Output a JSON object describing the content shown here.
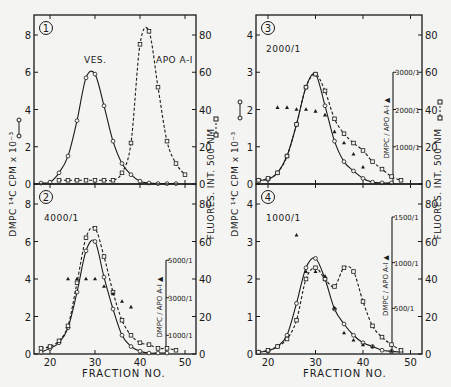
{
  "figure": {
    "x_axis_label": "FRACTION NO.",
    "x_ticks": [
      20,
      30,
      40,
      50
    ],
    "left_axis_label": "DMPC ¹⁴C CPM x 10⁻³",
    "left_axis_label_left_col": "DMPC ¹⁴C CPM x 10⁻²",
    "right_axis_label": "FLUORES. INT. 500 NM",
    "inner_axis_label": "DMPC / APO A-I",
    "legend_solid": "o—o",
    "legend_dashed": "□--□",
    "legend_triangle": "▲"
  },
  "chart_data": [
    {
      "panel": 1,
      "type": "line",
      "title": "",
      "annotations": [
        "VES.",
        "APO A-I"
      ],
      "xlabel": "FRACTION NO.",
      "ylabel": "DMPC 14C CPM x 10^-2",
      "y2label": "FLUORES. INT. 500 NM",
      "xlim": [
        16.4,
        52
      ],
      "ylim": [
        0,
        8.5
      ],
      "y_ticks": [
        0,
        2,
        4,
        6,
        8
      ],
      "y2lim": [
        0,
        85
      ],
      "y2_ticks": [
        0,
        20,
        40,
        60,
        80
      ],
      "series": [
        {
          "name": "DMPC 14C CPM (circles, solid)",
          "axis": "left",
          "x": [
            18,
            20,
            22,
            24,
            26,
            28,
            30,
            32,
            34,
            36,
            38,
            40,
            42,
            44,
            46,
            48
          ],
          "y": [
            0.05,
            0.1,
            0.6,
            1.5,
            3.4,
            5.7,
            5.9,
            4.2,
            2.3,
            1.1,
            0.5,
            0.15,
            0.05,
            0.02,
            0.02,
            0.02
          ]
        },
        {
          "name": "Fluorescence 500nm (squares, dashed)",
          "axis": "right",
          "x": [
            22,
            24,
            26,
            28,
            30,
            32,
            34,
            36,
            38,
            40,
            42,
            44,
            46,
            48,
            50
          ],
          "y": [
            2,
            2,
            2,
            2,
            2,
            2,
            2,
            6,
            22,
            75,
            82,
            52,
            23,
            11,
            5
          ]
        }
      ]
    },
    {
      "panel": 2,
      "type": "line",
      "annotations": [
        "4000/1"
      ],
      "xlabel": "FRACTION NO.",
      "ylabel": "DMPC 14C CPM x 10^-3",
      "y2label": "FLUORES. INT. 500 NM",
      "inner_axis": {
        "label": "DMPC / APO A-I",
        "ticks": [
          "1000/1",
          "3000/1",
          "5000/1"
        ],
        "range": [
          0,
          5000
        ]
      },
      "xlim": [
        16.4,
        52
      ],
      "ylim": [
        0,
        8.5
      ],
      "y_ticks": [
        0,
        2,
        4,
        6,
        8
      ],
      "y2lim": [
        0,
        85
      ],
      "y2_ticks": [
        0,
        20,
        40,
        60,
        80
      ],
      "series": [
        {
          "name": "DMPC 14C CPM (circles, solid)",
          "axis": "left",
          "x": [
            18,
            20,
            22,
            24,
            26,
            28,
            30,
            32,
            34,
            36,
            38,
            40,
            42,
            44,
            46
          ],
          "y": [
            0.1,
            0.3,
            0.6,
            1.4,
            3.3,
            5.5,
            6.0,
            4.1,
            2.4,
            1.0,
            0.4,
            0.15,
            0.05,
            0.05,
            0.05
          ]
        },
        {
          "name": "Fluorescence 500nm (squares, dashed)",
          "axis": "right",
          "x": [
            18,
            20,
            22,
            24,
            26,
            28,
            30,
            32,
            34,
            36,
            38,
            40,
            42,
            44,
            46,
            48
          ],
          "y": [
            3,
            4,
            7,
            15,
            38,
            62,
            67,
            52,
            33,
            18,
            10,
            6,
            5,
            3,
            3,
            2
          ]
        },
        {
          "name": "DMPC/APO A-I ratio (triangles)",
          "axis": "inner",
          "x": [
            24,
            26,
            28,
            30,
            32,
            34,
            36,
            38
          ],
          "y": [
            4000,
            4000,
            4000,
            4000,
            3600,
            3200,
            2800,
            2500
          ]
        }
      ]
    },
    {
      "panel": 3,
      "type": "line",
      "annotations": [
        "2000/1"
      ],
      "xlabel": "FRACTION NO.",
      "ylabel": "DMPC 14C CPM x 10^-3",
      "y2label": "FLUORES. INT. 500 NM",
      "inner_axis": {
        "label": "DMPC / APO A-I",
        "ticks": [
          "1000/1",
          "2000/1",
          "3000/1"
        ],
        "range": [
          0,
          3000
        ]
      },
      "xlim": [
        17.5,
        52
      ],
      "ylim": [
        0,
        4.25
      ],
      "y_ticks": [
        0,
        1,
        2,
        3,
        4
      ],
      "y2lim": [
        0,
        85
      ],
      "y2_ticks": [
        0,
        20,
        40,
        60,
        80
      ],
      "series": [
        {
          "name": "DMPC 14C CPM (circles, solid)",
          "axis": "left",
          "x": [
            18,
            20,
            22,
            24,
            26,
            28,
            30,
            32,
            34,
            36,
            38,
            40,
            42,
            44,
            46
          ],
          "y": [
            0.1,
            0.12,
            0.3,
            0.75,
            1.6,
            2.6,
            2.95,
            2.1,
            1.15,
            0.6,
            0.35,
            0.15,
            0.05,
            0.03,
            0.03
          ]
        },
        {
          "name": "Fluorescence 500nm (squares, dashed)",
          "axis": "right",
          "x": [
            18,
            20,
            22,
            24,
            26,
            28,
            30,
            32,
            34,
            36,
            38,
            40,
            42,
            44,
            46,
            48
          ],
          "y": [
            2,
            3,
            6,
            15,
            32,
            52,
            59,
            50,
            35,
            27,
            22,
            18,
            12,
            8,
            4,
            2
          ]
        },
        {
          "name": "DMPC/APO A-I ratio (triangles)",
          "axis": "inner",
          "x": [
            22,
            24,
            26,
            28,
            30,
            32,
            34,
            36,
            38,
            40
          ],
          "y": [
            2050,
            2050,
            2000,
            2000,
            1950,
            1850,
            1400,
            1100,
            800,
            450
          ]
        }
      ]
    },
    {
      "panel": 4,
      "type": "line",
      "annotations": [
        "1000/1"
      ],
      "xlabel": "FRACTION NO.",
      "ylabel": "DMPC 14C CPM x 10^-3",
      "y2label": "FLUORES. INT. 500 NM",
      "inner_axis": {
        "label": "DMPC / APO A-I",
        "ticks": [
          "500/1",
          "1000/1",
          "1500/1"
        ],
        "range": [
          0,
          1500
        ]
      },
      "xlim": [
        17.5,
        52
      ],
      "ylim": [
        0,
        4.25
      ],
      "y_ticks": [
        0,
        1,
        2,
        3,
        4
      ],
      "y2lim": [
        0,
        85
      ],
      "y2_ticks": [
        0,
        20,
        40,
        60,
        80
      ],
      "series": [
        {
          "name": "DMPC 14C CPM (circles, solid)",
          "axis": "left",
          "x": [
            18,
            20,
            22,
            24,
            26,
            28,
            30,
            32,
            34,
            36,
            38,
            40,
            42,
            44,
            46,
            48
          ],
          "y": [
            0.05,
            0.08,
            0.2,
            0.5,
            1.35,
            2.3,
            2.55,
            2.0,
            1.2,
            0.8,
            0.5,
            0.3,
            0.2,
            0.1,
            0.07,
            0.05
          ]
        },
        {
          "name": "Fluorescence 500nm (squares, dashed)",
          "axis": "right",
          "x": [
            18,
            20,
            22,
            24,
            26,
            28,
            30,
            32,
            34,
            36,
            38,
            40,
            42,
            44,
            46,
            48
          ],
          "y": [
            1,
            2,
            4,
            8,
            18,
            40,
            46,
            40,
            36,
            46,
            44,
            28,
            15,
            9,
            5,
            2
          ]
        },
        {
          "name": "DMPC/APO A-I ratio (triangles)",
          "axis": "inner",
          "x": [
            26,
            28,
            30,
            32,
            34,
            36,
            38,
            40,
            42,
            46
          ],
          "y": [
            1300,
            900,
            900,
            850,
            500,
            230,
            150,
            100,
            80,
            30
          ]
        }
      ]
    }
  ]
}
